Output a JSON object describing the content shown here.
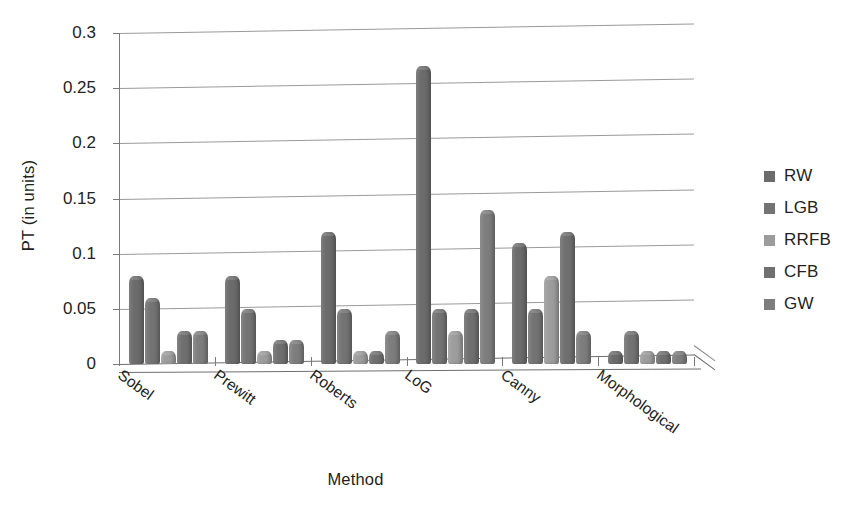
{
  "chart_data": {
    "type": "bar",
    "title": "",
    "xlabel": "Method",
    "ylabel": "PT (in units)",
    "categories": [
      "Sobel",
      "Prewitt",
      "Roberts",
      "LoG",
      "Canny",
      "Morphological"
    ],
    "series": [
      {
        "name": "RW",
        "color": "#6b6b6b",
        "values": [
          0.08,
          0.08,
          0.12,
          0.27,
          0.11,
          0.012
        ]
      },
      {
        "name": "LGB",
        "color": "#737373",
        "values": [
          0.06,
          0.05,
          0.05,
          0.05,
          0.05,
          0.03
        ]
      },
      {
        "name": "RRFB",
        "color": "#9c9c9c",
        "values": [
          0.012,
          0.012,
          0.012,
          0.03,
          0.08,
          0.012
        ]
      },
      {
        "name": "CFB",
        "color": "#6f6f6f",
        "values": [
          0.03,
          0.022,
          0.012,
          0.05,
          0.12,
          0.012
        ]
      },
      {
        "name": "GW",
        "color": "#7d7d7d",
        "values": [
          0.03,
          0.022,
          0.03,
          0.14,
          0.03,
          0.012
        ]
      }
    ],
    "ylim": [
      0,
      0.3
    ],
    "yticks": [
      0,
      0.05,
      0.1,
      0.15,
      0.2,
      0.25,
      0.3
    ],
    "ytick_labels": [
      "0",
      "0.05",
      "0.1",
      "0.15",
      "0.2",
      "0.25",
      "0.3"
    ],
    "grid": true,
    "legend_position": "right",
    "style": "3d-cylinder-bars"
  },
  "legend": {
    "items": [
      {
        "label": "RW"
      },
      {
        "label": "LGB"
      },
      {
        "label": "RRFB"
      },
      {
        "label": "CFB"
      },
      {
        "label": "GW"
      }
    ]
  }
}
